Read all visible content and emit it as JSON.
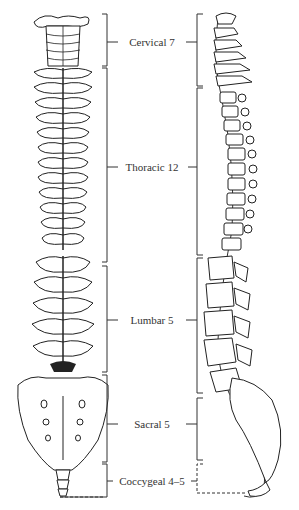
{
  "diagram": {
    "views": [
      "posterior-view",
      "lateral-view"
    ],
    "regions": [
      {
        "name": "Cervical",
        "count": "7",
        "label": "Cervical 7",
        "y": 42
      },
      {
        "name": "Thoracic",
        "count": "12",
        "label": "Thoracic 12",
        "y": 167
      },
      {
        "name": "Lumbar",
        "count": "5",
        "label": "Lumbar 5",
        "y": 320
      },
      {
        "name": "Sacral",
        "count": "5",
        "label": "Sacral 5",
        "y": 424
      },
      {
        "name": "Coccygeal",
        "count": "4–5",
        "label": "Coccygeal 4–5",
        "y": 481
      }
    ]
  }
}
